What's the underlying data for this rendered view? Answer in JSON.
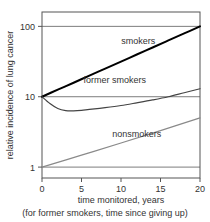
{
  "chart_data": {
    "type": "line",
    "title": "",
    "xlabel": "time monitored, years",
    "xlabel_note": "(for former smokers, time since giving up)",
    "ylabel": "relative incidence of lung cancer",
    "yscale": "log",
    "xlim": [
      0,
      20
    ],
    "ylim": [
      0.7,
      160
    ],
    "grid": true,
    "gridlines_y": [
      1,
      10,
      100
    ],
    "xticks": [
      0,
      5,
      10,
      15,
      20
    ],
    "xtick_labels": [
      "0",
      "5",
      "10",
      "15",
      "20"
    ],
    "yticks": [
      1,
      10,
      100
    ],
    "ytick_labels": [
      "1",
      "10",
      "100"
    ],
    "legend_position": "inline-annotations",
    "series": [
      {
        "name": "smokers",
        "color": "#000000",
        "width": 2.0,
        "label_x": 12.2,
        "label_y": 62,
        "x": [
          0,
          2,
          4,
          6,
          8,
          10,
          12,
          14,
          16,
          18,
          20
        ],
        "y": [
          10,
          12.6,
          15.8,
          20.0,
          25.1,
          31.6,
          39.8,
          50.1,
          63.1,
          79.4,
          100
        ]
      },
      {
        "name": "former smokers",
        "color": "#444444",
        "width": 1.2,
        "label_x": 9.2,
        "label_y": 17.5,
        "x": [
          0,
          1,
          2,
          3,
          4,
          5,
          6,
          8,
          10,
          12,
          14,
          16,
          18,
          20
        ],
        "y": [
          10,
          8.0,
          6.8,
          6.35,
          6.3,
          6.4,
          6.6,
          7.0,
          7.5,
          8.2,
          9.0,
          10.0,
          11.4,
          13.0
        ]
      },
      {
        "name": "nonsmokers",
        "color": "#8a8a8a",
        "width": 1.2,
        "label_x": 12.0,
        "label_y": 2.95,
        "x": [
          0,
          5,
          10,
          15,
          20
        ],
        "y": [
          1.0,
          1.48,
          2.2,
          3.3,
          5.0
        ]
      }
    ]
  }
}
